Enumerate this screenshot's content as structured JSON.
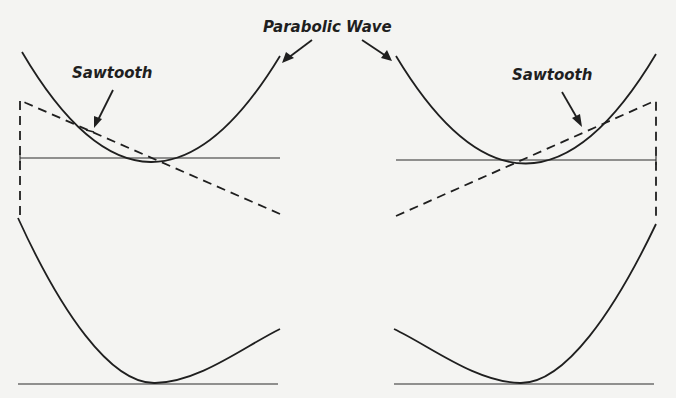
{
  "labels": {
    "parabolic_wave": "Parabolic Wave",
    "sawtooth_left": "Sawtooth",
    "sawtooth_right": "Sawtooth"
  },
  "colors": {
    "ink": "#1f1f1f",
    "paper": "#f4f4f2"
  }
}
